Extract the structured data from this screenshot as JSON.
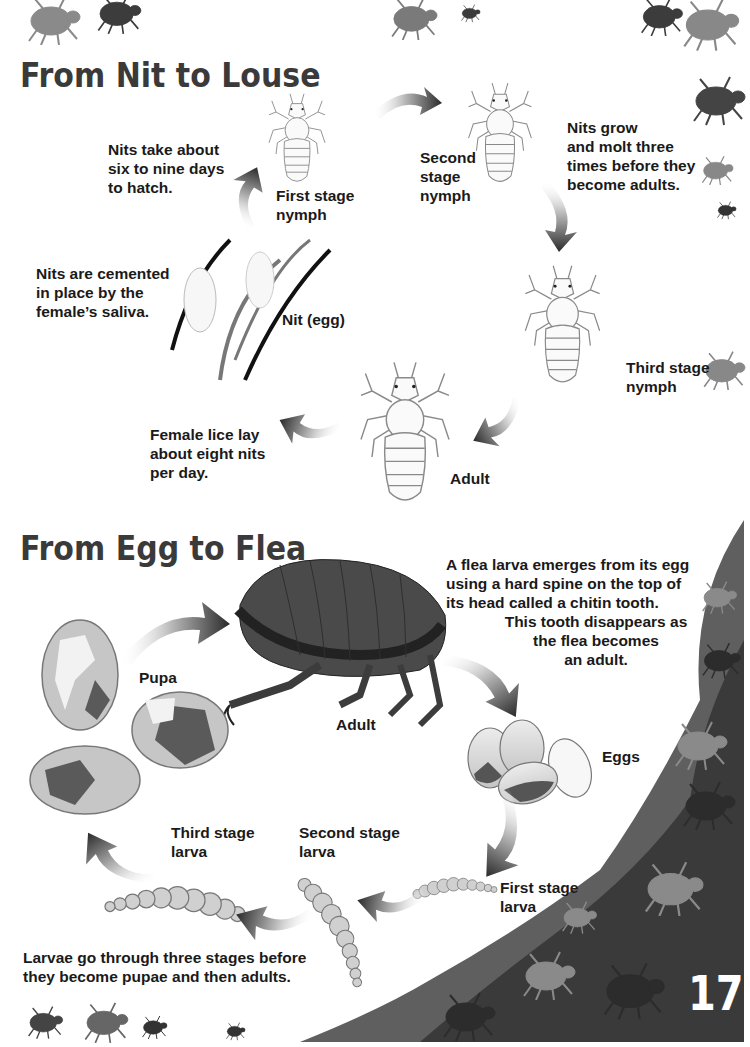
{
  "page": {
    "page_number": "17",
    "colors": {
      "text": "#1a1a1a",
      "title": "#3a3a3a",
      "silhouette_dark": "#3c3c3c",
      "silhouette_mid": "#7a7a7a",
      "outline": "#8a8a8a"
    }
  },
  "louse_section": {
    "title": "From Nit to Louse",
    "captions": {
      "hatch": "Nits take about\nsix to nine days\nto hatch.",
      "cemented": "Nits are cemented\nin place by the\nfemale’s saliva.",
      "lay": "Female lice lay\nabout eight nits\nper day.",
      "molt": "Nits grow\nand molt three\ntimes before they\nbecome adults."
    },
    "stages": {
      "first": "First stage\nnymph",
      "second": "Second\nstage\nnymph",
      "third": "Third stage\nnymph",
      "adult": "Adult",
      "nit": "Nit (egg)"
    }
  },
  "flea_section": {
    "title": "From Egg to Flea",
    "captions": {
      "chitin": "A flea larva emerges from its egg\nusing a hard spine on the top of\nits head called a chitin tooth.",
      "chitin_2": "This tooth disappears as\nthe flea becomes\nan adult.",
      "larvae": "Larvae go through three stages before\nthey become pupae and then adults."
    },
    "stages": {
      "pupa": "Pupa",
      "adult": "Adult",
      "eggs": "Eggs",
      "first_larva": "First stage\nlarva",
      "second_larva": "Second stage\nlarva",
      "third_larva": "Third stage\nlarva"
    }
  }
}
